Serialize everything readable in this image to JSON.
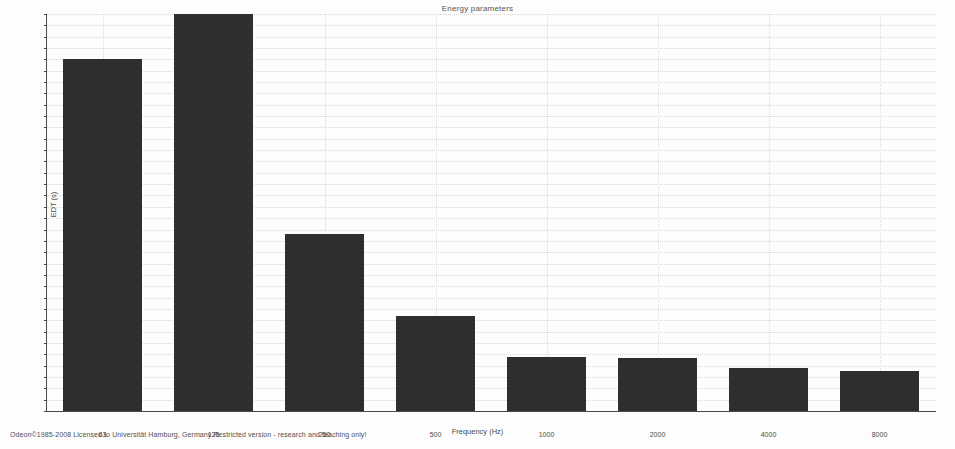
{
  "chart_data": {
    "type": "bar",
    "title": "Energy parameters",
    "xlabel": "Frequency (Hz)",
    "ylabel": "EDT (s)",
    "categories": [
      "63",
      "125",
      "250",
      "500",
      "1000",
      "2000",
      "4000",
      "8000"
    ],
    "values": [
      1.55,
      1.75,
      0.78,
      0.42,
      0.24,
      0.235,
      0.19,
      0.175
    ],
    "ylim": [
      0,
      1.75
    ],
    "ytick_step": 0.05,
    "ytick_labels": [
      "0",
      "0.05",
      "0.1",
      "0.15",
      "0.2",
      "0.25",
      "0.3",
      "0.35",
      "0.4",
      "0.45",
      "0.5",
      "0.55",
      "0.6",
      "0.65",
      "0.7",
      "0.75",
      "0.8",
      "0.85",
      "0.9",
      "0.95",
      "1",
      "1.05",
      "1.1",
      "1.15",
      "1.2",
      "1.25",
      "1.3",
      "1.35",
      "1.4",
      "1.45",
      "1.5",
      "1.55",
      "1.6",
      "1.65",
      "1.7",
      "1.75"
    ],
    "grid": true,
    "legend": "none",
    "bar_color": "#2e2e2e"
  },
  "footer": {
    "credit": "Odeon©1985-2008  Licensed to  Universität Hamburg, Germany   Restricted version - research and teaching only!"
  }
}
